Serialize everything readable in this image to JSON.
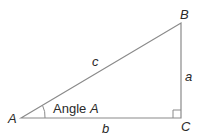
{
  "diagram": {
    "type": "right-triangle",
    "vertices": [
      {
        "id": "A",
        "label": "A",
        "x": 21,
        "y": 118
      },
      {
        "id": "B",
        "label": "B",
        "x": 181,
        "y": 23
      },
      {
        "id": "C",
        "label": "C",
        "x": 181,
        "y": 118
      }
    ],
    "sides": [
      {
        "id": "a",
        "label": "a",
        "from": "B",
        "to": "C"
      },
      {
        "id": "b",
        "label": "b",
        "from": "A",
        "to": "C"
      },
      {
        "id": "c",
        "label": "c",
        "from": "A",
        "to": "B"
      }
    ],
    "angle_label": {
      "prefix": "Angle ",
      "var": "A"
    },
    "right_angle_at": "C",
    "colors": {
      "line": "#8a8a8a",
      "text": "#2a2a2a"
    }
  }
}
